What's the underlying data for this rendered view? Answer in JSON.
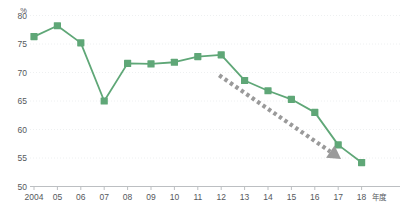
{
  "chart_data": {
    "type": "line",
    "title": "",
    "xlabel": "年度",
    "ylabel": "%",
    "categories": [
      "2004",
      "05",
      "06",
      "07",
      "08",
      "09",
      "10",
      "11",
      "12",
      "13",
      "14",
      "15",
      "16",
      "17",
      "18"
    ],
    "values": [
      76.3,
      78.2,
      75.2,
      65.0,
      71.6,
      71.5,
      71.8,
      72.8,
      73.1,
      68.6,
      66.8,
      65.3,
      63.0,
      57.3,
      54.2
    ],
    "series": [
      {
        "name": "割合",
        "color": "#5FA777",
        "values": [
          76.3,
          78.2,
          75.2,
          65.0,
          71.6,
          71.5,
          71.8,
          72.8,
          73.1,
          68.6,
          66.8,
          65.3,
          63.0,
          57.3,
          54.2
        ]
      }
    ],
    "ylim": [
      50,
      80
    ],
    "ytick_values": [
      50,
      55,
      60,
      65,
      70,
      75,
      80
    ],
    "ytick_labels": [
      "50",
      "55",
      "60",
      "65",
      "70",
      "75",
      "80"
    ],
    "grid": true,
    "legend": "none",
    "annotations": [
      {
        "name": "downtrend-arrow",
        "type": "dashed-arrow",
        "color": "#9a9a9a",
        "from_year": "12",
        "to_year": "17",
        "from_value": 69.5,
        "to_value": 55.4,
        "label": ""
      }
    ]
  },
  "axis": {
    "y_unit": "%",
    "x_caption": "年度"
  },
  "colors": {
    "series_green": "#5FA777",
    "arrow_gray": "#9a9a9a",
    "gridline": "#eef0f1",
    "axis": "#bcbfc2",
    "text": "#55585c",
    "background": "#ffffff"
  }
}
